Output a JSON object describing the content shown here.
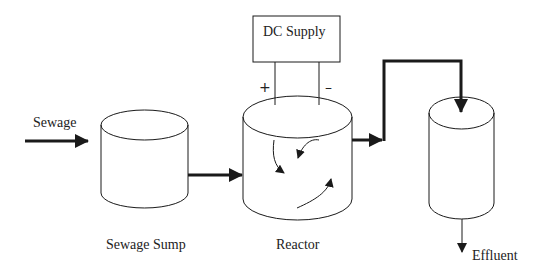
{
  "diagram": {
    "type": "process-flow",
    "colors": {
      "background": "#ffffff",
      "stroke": "#1a1a1a",
      "text": "#222222"
    },
    "nodes": [
      {
        "id": "sewage_sump",
        "label": "Sewage Sump",
        "shape": "cylinder"
      },
      {
        "id": "reactor",
        "label": "Reactor",
        "shape": "cylinder"
      },
      {
        "id": "settler",
        "label": "",
        "shape": "cylinder"
      },
      {
        "id": "dc_supply",
        "label": "DC Supply",
        "shape": "rectangle"
      }
    ],
    "labels": {
      "inlet": "Sewage",
      "sump": "Sewage Sump",
      "reactor": "Reactor",
      "dc_supply": "DC Supply",
      "positive": "+",
      "negative": "–",
      "outlet": "Effluent"
    },
    "edges": [
      {
        "from": "inlet",
        "to": "sewage_sump",
        "label": "Sewage"
      },
      {
        "from": "sewage_sump",
        "to": "reactor",
        "label": ""
      },
      {
        "from": "reactor",
        "to": "settler",
        "label": ""
      },
      {
        "from": "settler",
        "to": "outlet",
        "label": "Effluent"
      },
      {
        "from": "dc_supply",
        "to": "reactor",
        "label": "+ electrode"
      },
      {
        "from": "dc_supply",
        "to": "reactor",
        "label": "– electrode"
      }
    ]
  }
}
